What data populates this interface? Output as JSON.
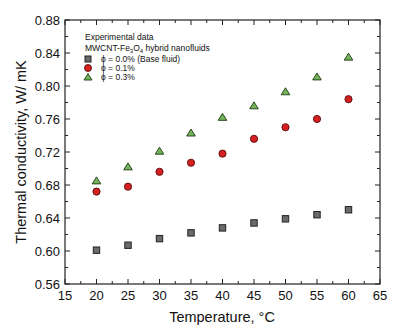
{
  "chart_data": {
    "type": "scatter",
    "title": "",
    "xlabel": "Temperature, °C",
    "ylabel": "Thermal conductivity, W/ mK",
    "xlim": [
      15,
      65
    ],
    "ylim": [
      0.56,
      0.88
    ],
    "x_ticks": [
      15,
      20,
      25,
      30,
      35,
      40,
      45,
      50,
      55,
      60,
      65
    ],
    "y_ticks": [
      0.56,
      0.6,
      0.64,
      0.68,
      0.72,
      0.76,
      0.8,
      0.84,
      0.88
    ],
    "grid": false,
    "legend_position": "upper left",
    "legend_title_lines": [
      "Experimental data",
      "MWCNT-Fe3O4 hybrid nanofluids"
    ],
    "x": [
      20,
      25,
      30,
      35,
      40,
      45,
      50,
      55,
      60
    ],
    "series": [
      {
        "name": "ϕ = 0.0% (Base fluid)",
        "marker": "square",
        "color": "#555555",
        "values": [
          0.601,
          0.607,
          0.615,
          0.622,
          0.628,
          0.634,
          0.639,
          0.644,
          0.65
        ]
      },
      {
        "name": "ϕ = 0.1%",
        "marker": "circle",
        "color": "#cc2020",
        "values": [
          0.672,
          0.678,
          0.696,
          0.707,
          0.718,
          0.736,
          0.75,
          0.76,
          0.784
        ]
      },
      {
        "name": "ϕ = 0.3%",
        "marker": "triangle",
        "color": "#6aa84f",
        "values": [
          0.685,
          0.702,
          0.721,
          0.743,
          0.762,
          0.776,
          0.793,
          0.811,
          0.835
        ]
      }
    ]
  },
  "labels": {
    "xlabel_text": "Temperature, ",
    "xlabel_unit": "°C",
    "ylabel": "Thermal conductivity, W/ mK",
    "legend_line1": "Experimental data",
    "legend_line2_prefix": "MWCNT-Fe",
    "legend_line2_sub1": "3",
    "legend_line2_mid": "O",
    "legend_line2_sub2": "4",
    "legend_line2_suffix": " hybrid nanofluids",
    "series0": "ϕ = 0.0% (Base fluid)",
    "series1": "ϕ = 0.1%",
    "series2": "ϕ = 0.3%"
  }
}
